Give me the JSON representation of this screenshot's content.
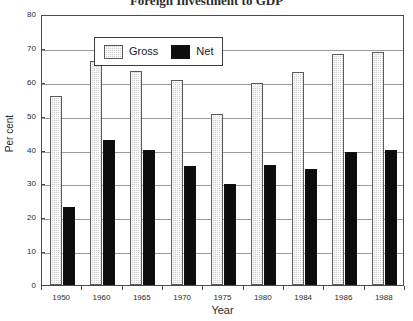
{
  "chart_data": {
    "type": "bar",
    "title": "Foreign Investment to GDP",
    "xlabel": "Year",
    "ylabel": "Per cent",
    "categories": [
      "1950",
      "1960",
      "1965",
      "1970",
      "1975",
      "1980",
      "1984",
      "1986",
      "1988"
    ],
    "series": [
      {
        "name": "Gross",
        "color": "#cfcfcf",
        "values": [
          55.8,
          66.0,
          63.2,
          60.5,
          50.5,
          59.6,
          62.9,
          68.3,
          68.8
        ]
      },
      {
        "name": "Net",
        "color": "#0d0d0d",
        "values": [
          23.0,
          42.7,
          39.8,
          35.0,
          29.8,
          35.5,
          34.3,
          39.3,
          39.8
        ]
      }
    ],
    "ylim": [
      0,
      80
    ],
    "yticks": [
      0,
      10,
      20,
      30,
      40,
      50,
      60,
      70,
      80
    ],
    "ytick_labels": [
      "0",
      "10",
      "20",
      "30",
      "40",
      "50",
      "60",
      "70",
      "80"
    ],
    "grid": true,
    "grid_axis": "y",
    "legend_position": "upper left",
    "legend_entries": [
      "Gross",
      "Net"
    ]
  }
}
